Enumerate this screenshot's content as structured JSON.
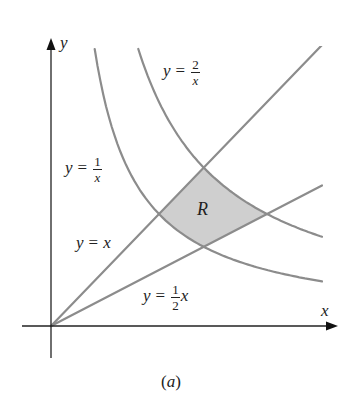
{
  "figure": {
    "caption": "(a)",
    "axes": {
      "x_label": "x",
      "y_label": "y"
    },
    "region": {
      "label": "R",
      "fill": "#cfcfcf",
      "stroke": "#8c8c8c"
    },
    "curves": [
      {
        "id": "y_eq_1_over_x",
        "lhs": "y",
        "eq": "=",
        "num": "1",
        "den": "x",
        "kind": "hyperbola",
        "k": 1
      },
      {
        "id": "y_eq_2_over_x",
        "lhs": "y",
        "eq": "=",
        "num": "2",
        "den": "x",
        "kind": "hyperbola",
        "k": 2
      },
      {
        "id": "y_eq_x",
        "lhs": "y",
        "eq": "=",
        "rhs": "x",
        "kind": "line",
        "m": 1
      },
      {
        "id": "y_eq_half_x",
        "lhs": "y",
        "eq": "=",
        "num": "1",
        "den": "2",
        "rhs": "x",
        "kind": "line",
        "m": 0.5
      }
    ],
    "colors": {
      "curve": "#8c8c8c",
      "axis": "#222222",
      "text": "#222222"
    }
  },
  "chart_data": {
    "type": "line",
    "title": "",
    "xlabel": "x",
    "ylabel": "y",
    "caption": "(a)",
    "grid": false,
    "series": [
      {
        "name": "y = 1/x",
        "function": "1/x"
      },
      {
        "name": "y = 2/x",
        "function": "2/x"
      },
      {
        "name": "y = x",
        "function": "x"
      },
      {
        "name": "y = (1/2)x",
        "function": "0.5*x"
      }
    ],
    "shaded_region": {
      "label": "R",
      "bounded_by": [
        "y = 1/x",
        "y = 2/x",
        "y = x",
        "y = (1/2)x"
      ],
      "vertices": [
        [
          1,
          1
        ],
        [
          1.414,
          1.414
        ],
        [
          2,
          1
        ],
        [
          1.414,
          0.707
        ]
      ]
    },
    "xlim": [
      -0.27,
      2.64
    ],
    "ylim": [
      -0.29,
      2.6
    ]
  }
}
